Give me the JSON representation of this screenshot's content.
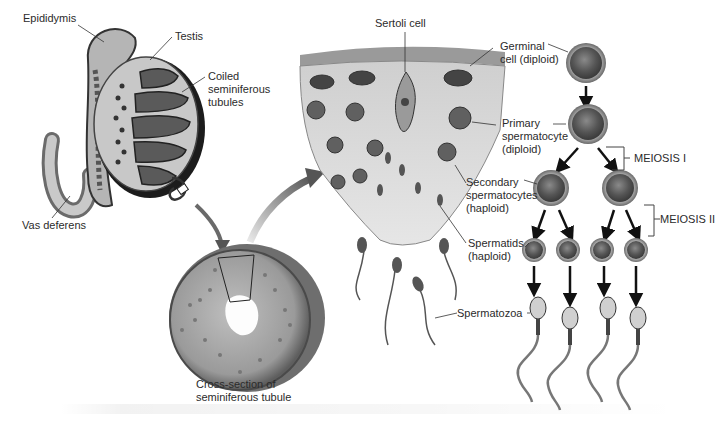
{
  "figure": {
    "topic": "Spermatogenesis",
    "labels": {
      "epididymis": "Epididymis",
      "testis": "Testis",
      "coiled_tubules": "Coiled\nseminiferous\ntubules",
      "vas_deferens": "Vas deferens",
      "cross_section": "Cross-section of\nseminiferous tubule",
      "sertoli_cell": "Sertoli cell",
      "germinal_cell": "Germinal\ncell (diploid)",
      "primary_spermatocyte": "Primary\nspermatocyte\n(diploid)",
      "secondary_spermatocytes": "Secondary\nspermatocytes\n(haploid)",
      "spermatids": "Spermatids\n(haploid)",
      "spermatozoa": "Spermatozoa",
      "meiosis_1": "MEIOSIS I",
      "meiosis_2": "MEIOSIS II"
    },
    "stages": [
      {
        "name": "Germinal cell",
        "ploidy": "diploid",
        "count": 1
      },
      {
        "name": "Primary spermatocyte",
        "ploidy": "diploid",
        "count": 1
      },
      {
        "name": "Secondary spermatocytes",
        "ploidy": "haploid",
        "count": 2
      },
      {
        "name": "Spermatids",
        "ploidy": "haploid",
        "count": 4
      },
      {
        "name": "Spermatozoa",
        "count": 4
      }
    ],
    "colors": {
      "cell_fill": "#6e6e6e",
      "cell_rim": "#9a9a9a",
      "line": "#333333",
      "tissue": "#d9d9d9"
    }
  }
}
